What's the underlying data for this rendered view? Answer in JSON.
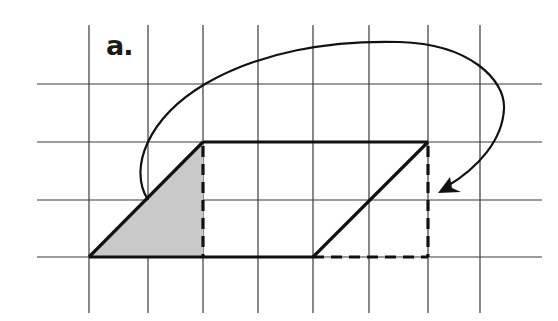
{
  "figure": {
    "label": "a.",
    "colors": {
      "grid": "#3a3a3a",
      "outline": "#111111",
      "shade": "#c9c9c9",
      "background": "#ffffff"
    },
    "grid": {
      "vertical_lines_x": [
        89,
        148,
        203,
        258,
        313,
        369,
        428,
        480
      ],
      "horizontal_lines_y": [
        84,
        142,
        200,
        257
      ],
      "x_extent": [
        37,
        542
      ],
      "y_extent": [
        25,
        313
      ]
    },
    "parallelogram": {
      "vertices": [
        [
          89,
          257
        ],
        [
          203,
          142
        ],
        [
          428,
          142
        ],
        [
          313,
          257
        ]
      ]
    },
    "shaded_triangle": {
      "vertices": [
        [
          89,
          257
        ],
        [
          203,
          142
        ],
        [
          203,
          257
        ]
      ]
    },
    "dashed_edges": [
      {
        "from": [
          203,
          142
        ],
        "to": [
          203,
          257
        ]
      },
      {
        "from": [
          428,
          142
        ],
        "to": [
          428,
          257
        ]
      },
      {
        "from": [
          313,
          257
        ],
        "to": [
          428,
          257
        ]
      }
    ],
    "arrow": {
      "start": [
        148,
        200
      ],
      "end": [
        438,
        192
      ],
      "direction": "clockwise arc over the top"
    }
  }
}
